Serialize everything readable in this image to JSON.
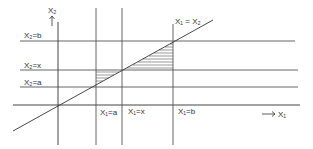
{
  "diagram": {
    "axes": {
      "x_axis_label": "X₁",
      "y_axis_label": "X₂"
    },
    "diagonal_label": "X₁ = X₂",
    "horizontal_line_labels": {
      "x2_b": "X₂=b",
      "x2_x": "X₂=x",
      "x2_a": "X₂=a"
    },
    "vertical_line_labels": {
      "x1_a": "X₁=a",
      "x1_x": "X₁=x",
      "x1_b": "X₁=b"
    },
    "shaded_regions": [
      "triangle between X₁=a, X₂=x and diagonal (hatched)",
      "triangle between X₁=b, X₂=x and diagonal (hatched)"
    ],
    "colors": {
      "line": "#333333",
      "hatch": "#555555",
      "background": "#ffffff"
    }
  }
}
